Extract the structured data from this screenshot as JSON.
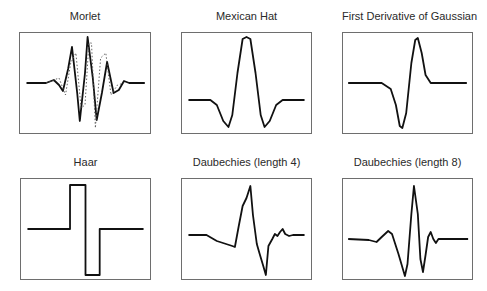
{
  "figure": {
    "panels": [
      {
        "id": "morlet",
        "title": "Morlet",
        "box": {
          "x": 19,
          "y": 32,
          "w": 132,
          "h": 101
        },
        "title_y": 12
      },
      {
        "id": "mexican-hat",
        "title": "Mexican Hat",
        "box": {
          "x": 181,
          "y": 32,
          "w": 131,
          "h": 101
        },
        "title_y": 12
      },
      {
        "id": "first-derivative-gaussian",
        "title": "First Derivative of Gaussian",
        "box": {
          "x": 342,
          "y": 32,
          "w": 131,
          "h": 101
        },
        "title_y": 12
      },
      {
        "id": "haar",
        "title": "Haar",
        "box": {
          "x": 20,
          "y": 178,
          "w": 131,
          "h": 101
        },
        "title_y": 158
      },
      {
        "id": "daubechies-4",
        "title": "Daubechies (length 4)",
        "box": {
          "x": 181,
          "y": 178,
          "w": 131,
          "h": 101
        },
        "title_y": 158
      },
      {
        "id": "daubechies-8",
        "title": "Daubechies (length 8)",
        "box": {
          "x": 342,
          "y": 178,
          "w": 131,
          "h": 101
        },
        "title_y": 158
      }
    ]
  },
  "chart_data": [
    {
      "type": "line",
      "title": "Morlet",
      "xlabel": "",
      "ylabel": "",
      "grid": false,
      "series": [
        {
          "name": "real part",
          "style": "solid",
          "points": [
            [
              0.05,
              0.5
            ],
            [
              0.2,
              0.5
            ],
            [
              0.26,
              0.47
            ],
            [
              0.3,
              0.52
            ],
            [
              0.33,
              0.58
            ],
            [
              0.37,
              0.36
            ],
            [
              0.4,
              0.14
            ],
            [
              0.44,
              0.6
            ],
            [
              0.46,
              0.88
            ],
            [
              0.5,
              0.4
            ],
            [
              0.52,
              0.04
            ],
            [
              0.56,
              0.45
            ],
            [
              0.59,
              0.87
            ],
            [
              0.63,
              0.6
            ],
            [
              0.67,
              0.29
            ],
            [
              0.72,
              0.6
            ],
            [
              0.76,
              0.57
            ],
            [
              0.8,
              0.48
            ],
            [
              0.84,
              0.5
            ],
            [
              0.96,
              0.5
            ]
          ]
        },
        {
          "name": "imaginary part",
          "style": "dotted",
          "points": [
            [
              0.2,
              0.5
            ],
            [
              0.3,
              0.45
            ],
            [
              0.35,
              0.62
            ],
            [
              0.39,
              0.3
            ],
            [
              0.43,
              0.2
            ],
            [
              0.47,
              0.75
            ],
            [
              0.5,
              0.72
            ],
            [
              0.53,
              0.1
            ],
            [
              0.55,
              0.1
            ],
            [
              0.58,
              0.95
            ],
            [
              0.62,
              0.25
            ],
            [
              0.66,
              0.2
            ],
            [
              0.7,
              0.62
            ],
            [
              0.75,
              0.52
            ],
            [
              0.8,
              0.5
            ]
          ]
        }
      ]
    },
    {
      "type": "line",
      "title": "Mexican Hat",
      "xlabel": "",
      "ylabel": "",
      "grid": false,
      "series": [
        {
          "name": "psi",
          "style": "solid",
          "points": [
            [
              0.05,
              0.67
            ],
            [
              0.22,
              0.67
            ],
            [
              0.27,
              0.72
            ],
            [
              0.32,
              0.88
            ],
            [
              0.36,
              0.94
            ],
            [
              0.39,
              0.82
            ],
            [
              0.43,
              0.4
            ],
            [
              0.47,
              0.06
            ],
            [
              0.5,
              0.04
            ],
            [
              0.53,
              0.06
            ],
            [
              0.57,
              0.4
            ],
            [
              0.61,
              0.82
            ],
            [
              0.64,
              0.94
            ],
            [
              0.68,
              0.88
            ],
            [
              0.73,
              0.72
            ],
            [
              0.78,
              0.67
            ],
            [
              0.95,
              0.67
            ]
          ]
        }
      ]
    },
    {
      "type": "line",
      "title": "First Derivative of Gaussian",
      "xlabel": "",
      "ylabel": "",
      "grid": false,
      "series": [
        {
          "name": "psi",
          "style": "solid",
          "points": [
            [
              0.04,
              0.5
            ],
            [
              0.3,
              0.5
            ],
            [
              0.37,
              0.56
            ],
            [
              0.41,
              0.72
            ],
            [
              0.44,
              0.93
            ],
            [
              0.46,
              0.95
            ],
            [
              0.49,
              0.8
            ],
            [
              0.53,
              0.3
            ],
            [
              0.56,
              0.07
            ],
            [
              0.58,
              0.05
            ],
            [
              0.61,
              0.2
            ],
            [
              0.64,
              0.42
            ],
            [
              0.68,
              0.5
            ],
            [
              0.96,
              0.5
            ]
          ]
        }
      ]
    },
    {
      "type": "line",
      "title": "Haar",
      "xlabel": "",
      "ylabel": "",
      "grid": false,
      "series": [
        {
          "name": "psi",
          "style": "solid",
          "points": [
            [
              0.05,
              0.5
            ],
            [
              0.38,
              0.5
            ],
            [
              0.38,
              0.06
            ],
            [
              0.5,
              0.06
            ],
            [
              0.5,
              0.96
            ],
            [
              0.61,
              0.96
            ],
            [
              0.61,
              0.5
            ],
            [
              0.95,
              0.5
            ]
          ]
        }
      ]
    },
    {
      "type": "line",
      "title": "Daubechies (length 4)",
      "xlabel": "",
      "ylabel": "",
      "grid": false,
      "series": [
        {
          "name": "psi",
          "style": "solid",
          "points": [
            [
              0.05,
              0.56
            ],
            [
              0.19,
              0.56
            ],
            [
              0.27,
              0.62
            ],
            [
              0.39,
              0.67
            ],
            [
              0.41,
              0.68
            ],
            [
              0.44,
              0.47
            ],
            [
              0.47,
              0.27
            ],
            [
              0.5,
              0.19
            ],
            [
              0.53,
              0.07
            ],
            [
              0.55,
              0.36
            ],
            [
              0.58,
              0.65
            ],
            [
              0.6,
              0.74
            ],
            [
              0.63,
              0.87
            ],
            [
              0.65,
              0.96
            ],
            [
              0.67,
              0.67
            ],
            [
              0.7,
              0.6
            ],
            [
              0.72,
              0.55
            ],
            [
              0.74,
              0.57
            ],
            [
              0.76,
              0.53
            ],
            [
              0.78,
              0.5
            ],
            [
              0.8,
              0.55
            ],
            [
              0.83,
              0.57
            ],
            [
              0.86,
              0.56
            ],
            [
              0.95,
              0.56
            ]
          ]
        }
      ]
    },
    {
      "type": "line",
      "title": "Daubechies (length 8)",
      "xlabel": "",
      "ylabel": "",
      "grid": false,
      "series": [
        {
          "name": "psi",
          "style": "solid",
          "points": [
            [
              0.04,
              0.6
            ],
            [
              0.2,
              0.61
            ],
            [
              0.26,
              0.63
            ],
            [
              0.3,
              0.58
            ],
            [
              0.35,
              0.52
            ],
            [
              0.38,
              0.55
            ],
            [
              0.43,
              0.75
            ],
            [
              0.48,
              0.97
            ],
            [
              0.5,
              0.85
            ],
            [
              0.53,
              0.35
            ],
            [
              0.55,
              0.07
            ],
            [
              0.58,
              0.35
            ],
            [
              0.6,
              0.8
            ],
            [
              0.62,
              0.93
            ],
            [
              0.64,
              0.76
            ],
            [
              0.66,
              0.58
            ],
            [
              0.68,
              0.53
            ],
            [
              0.7,
              0.6
            ],
            [
              0.72,
              0.64
            ],
            [
              0.74,
              0.6
            ],
            [
              0.8,
              0.6
            ],
            [
              0.97,
              0.6
            ]
          ]
        }
      ]
    }
  ]
}
